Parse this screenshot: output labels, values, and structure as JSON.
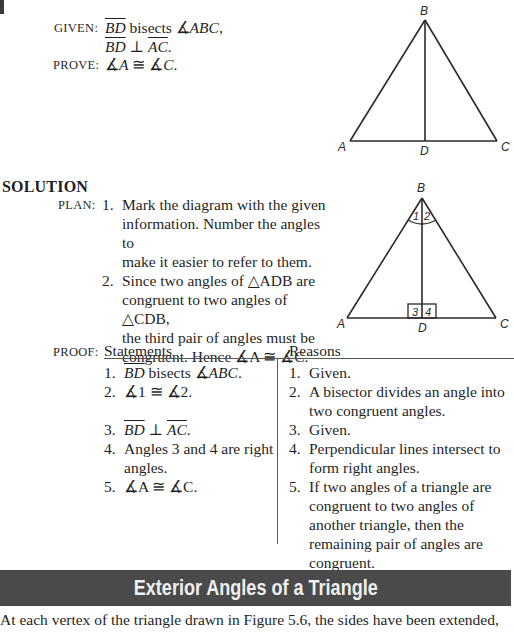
{
  "problem": {
    "given_label": "GIVEN:",
    "given_line1": {
      "seg": "BD",
      "text": " bisects ∡",
      "angle": "ABC",
      "end": ","
    },
    "given_line2": {
      "seg1": "BD",
      "op": " ⊥ ",
      "seg2": "AC",
      "end": "."
    },
    "prove_label": "PROVE:",
    "prove": {
      "a1": "∡",
      "v1": "A",
      "op": " ≅ ",
      "a2": "∡",
      "v2": "C",
      "end": "."
    }
  },
  "figure_top": {
    "labels": {
      "B": "B",
      "A": "A",
      "D": "D",
      "C": "C"
    }
  },
  "solution": {
    "heading": "SOLUTION",
    "plan_label": "PLAN:",
    "plan": [
      {
        "num": "1.",
        "lines": [
          "Mark the diagram with the given",
          "information. Number the angles to",
          "make it easier to refer to them."
        ]
      },
      {
        "num": "2.",
        "lines": [
          "Since two angles of △ADB are",
          "congruent to two angles of △CDB,",
          "the third pair of angles must be",
          "congruent. Hence ∡A ≅ ∡C."
        ]
      }
    ]
  },
  "figure_solution": {
    "labels": {
      "B": "B",
      "A": "A",
      "D": "D",
      "C": "C",
      "a1": "1",
      "a2": "2",
      "a3": "3",
      "a4": "4"
    }
  },
  "proof": {
    "label": "PROOF:",
    "statements_header": "Statements",
    "reasons_header": "Reasons",
    "statements": [
      {
        "num": "1.",
        "text": "BD bisects ∡ABC."
      },
      {
        "num": "2.",
        "text": "∡1 ≅ ∡2."
      },
      {
        "num": "3.",
        "text": "BD ⊥ AC."
      },
      {
        "num": "4.",
        "text": "Angles 3 and 4 are right angles."
      },
      {
        "num": "5.",
        "text": "∡A ≅ ∡C."
      }
    ],
    "reasons": [
      {
        "num": "1.",
        "text": "Given."
      },
      {
        "num": "2.",
        "text": "A bisector divides an angle into two congruent angles."
      },
      {
        "num": "3.",
        "text": "Given."
      },
      {
        "num": "4.",
        "text": "Perpendicular lines intersect to form right angles."
      },
      {
        "num": "5.",
        "text": "If two angles of a triangle are congruent to two angles of another triangle, then the remaining pair of angles are congruent."
      }
    ]
  },
  "section": {
    "title": "Exterior Angles of a Triangle",
    "intro": "At each vertex of the triangle drawn in Figure 5.6, the sides have been extended,"
  }
}
